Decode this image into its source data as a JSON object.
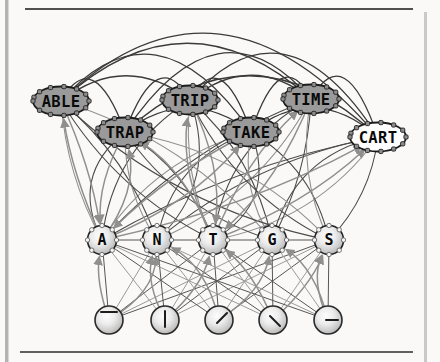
{
  "figure": {
    "background": "#faf9f7",
    "frame": {
      "left_bar_color": "#b3b3b3",
      "right_bar_color": "#c9c9c9",
      "top_rule_color": "#4f4f4f",
      "bottom_rule_color": "#5f5f5f"
    },
    "colors": {
      "word_fill": "#9a9a9a",
      "cart_fill": "#fefefe",
      "node_stroke": "#1c1c1c",
      "label_color": "#0a0a0a",
      "edge_dark": "#3a3a3a",
      "edge_mid": "#4a4a4a",
      "edge_gray": "#8f8f8f",
      "knob_fill": "#8d8d8d",
      "knob_stroke": "#1f1f1f",
      "letter_knob_fill": "#f4f4f4",
      "letter_knob_stroke": "#555555",
      "glyph_color": "#1d1d1d"
    }
  },
  "nodes": {
    "words": [
      {
        "id": "ABLE",
        "label": "ABLE",
        "x": 61,
        "y": 101,
        "fill": "word"
      },
      {
        "id": "TRAP",
        "label": "TRAP",
        "x": 125,
        "y": 132,
        "fill": "word"
      },
      {
        "id": "TRIP",
        "label": "TRIP",
        "x": 190,
        "y": 100,
        "fill": "word"
      },
      {
        "id": "TAKE",
        "label": "TAKE",
        "x": 251,
        "y": 132,
        "fill": "word"
      },
      {
        "id": "TIME",
        "label": "TIME",
        "x": 311,
        "y": 99,
        "fill": "word"
      },
      {
        "id": "CART",
        "label": "CART",
        "x": 378,
        "y": 137,
        "fill": "cart"
      }
    ],
    "letters": [
      {
        "id": "A",
        "label": "A",
        "x": 102,
        "y": 240
      },
      {
        "id": "N",
        "label": "N",
        "x": 157,
        "y": 240
      },
      {
        "id": "T",
        "label": "T",
        "x": 213,
        "y": 240
      },
      {
        "id": "G",
        "label": "G",
        "x": 272,
        "y": 240
      },
      {
        "id": "S",
        "label": "S",
        "x": 329,
        "y": 240
      }
    ],
    "features": [
      {
        "id": "feat-top-bar",
        "glyph": "horizontal-bar-top",
        "x": 109,
        "y": 320,
        "segment": [
          -8,
          -8,
          8,
          -8
        ]
      },
      {
        "id": "feat-vertical",
        "glyph": "vertical-bar",
        "x": 165,
        "y": 320,
        "segment": [
          0,
          -9,
          0,
          7
        ]
      },
      {
        "id": "feat-diag-up",
        "glyph": "diagonal-rising",
        "x": 219,
        "y": 320,
        "segment": [
          -2,
          3,
          8,
          -7
        ]
      },
      {
        "id": "feat-diag-down",
        "glyph": "diagonal-falling",
        "x": 273,
        "y": 320,
        "segment": [
          -3,
          -4,
          7,
          6
        ]
      },
      {
        "id": "feat-horizontal",
        "glyph": "horizontal-bar-right",
        "x": 328,
        "y": 320,
        "segment": [
          -2,
          0,
          10,
          0
        ]
      }
    ]
  },
  "edges": {
    "word_word_inhibitory": [
      [
        "ABLE",
        "TRAP"
      ],
      [
        "ABLE",
        "TRIP"
      ],
      [
        "ABLE",
        "TAKE"
      ],
      [
        "ABLE",
        "TIME"
      ],
      [
        "ABLE",
        "CART"
      ],
      [
        "TRAP",
        "TRIP"
      ],
      [
        "TRAP",
        "TAKE"
      ],
      [
        "TRAP",
        "TIME"
      ],
      [
        "TRAP",
        "CART"
      ],
      [
        "TRIP",
        "TAKE"
      ],
      [
        "TRIP",
        "TIME"
      ],
      [
        "TRIP",
        "CART"
      ],
      [
        "TAKE",
        "TIME"
      ],
      [
        "TAKE",
        "CART"
      ],
      [
        "TIME",
        "CART"
      ]
    ],
    "letter_word": [
      [
        "A",
        "ABLE"
      ],
      [
        "A",
        "TRAP"
      ],
      [
        "A",
        "TRIP"
      ],
      [
        "A",
        "TAKE"
      ],
      [
        "A",
        "TIME"
      ],
      [
        "A",
        "CART"
      ],
      [
        "N",
        "ABLE"
      ],
      [
        "N",
        "TRAP"
      ],
      [
        "N",
        "TRIP"
      ],
      [
        "N",
        "TAKE"
      ],
      [
        "N",
        "TIME"
      ],
      [
        "N",
        "CART"
      ],
      [
        "T",
        "ABLE"
      ],
      [
        "T",
        "TRAP"
      ],
      [
        "T",
        "TRIP"
      ],
      [
        "T",
        "TAKE"
      ],
      [
        "T",
        "TIME"
      ],
      [
        "T",
        "CART"
      ],
      [
        "G",
        "ABLE"
      ],
      [
        "G",
        "TRAP"
      ],
      [
        "G",
        "TRIP"
      ],
      [
        "G",
        "TAKE"
      ],
      [
        "G",
        "TIME"
      ],
      [
        "G",
        "CART"
      ],
      [
        "S",
        "ABLE"
      ],
      [
        "S",
        "TRAP"
      ],
      [
        "S",
        "TRIP"
      ],
      [
        "S",
        "TAKE"
      ],
      [
        "S",
        "TIME"
      ],
      [
        "S",
        "CART"
      ]
    ],
    "letter_letter_inhibitory": [
      [
        "A",
        "S"
      ]
    ],
    "feature_letter": [
      [
        "feat-top-bar",
        "A"
      ],
      [
        "feat-top-bar",
        "N"
      ],
      [
        "feat-top-bar",
        "T"
      ],
      [
        "feat-top-bar",
        "G"
      ],
      [
        "feat-top-bar",
        "S"
      ],
      [
        "feat-vertical",
        "A"
      ],
      [
        "feat-vertical",
        "N"
      ],
      [
        "feat-vertical",
        "T"
      ],
      [
        "feat-vertical",
        "G"
      ],
      [
        "feat-vertical",
        "S"
      ],
      [
        "feat-diag-up",
        "A"
      ],
      [
        "feat-diag-up",
        "N"
      ],
      [
        "feat-diag-up",
        "T"
      ],
      [
        "feat-diag-up",
        "G"
      ],
      [
        "feat-diag-up",
        "S"
      ],
      [
        "feat-diag-down",
        "A"
      ],
      [
        "feat-diag-down",
        "N"
      ],
      [
        "feat-diag-down",
        "T"
      ],
      [
        "feat-diag-down",
        "G"
      ],
      [
        "feat-diag-down",
        "S"
      ],
      [
        "feat-horizontal",
        "A"
      ],
      [
        "feat-horizontal",
        "N"
      ],
      [
        "feat-horizontal",
        "T"
      ],
      [
        "feat-horizontal",
        "G"
      ],
      [
        "feat-horizontal",
        "S"
      ]
    ],
    "excitatory_arrows": {
      "letter_to_word": [
        [
          "A",
          "ABLE"
        ],
        [
          "A",
          "TRAP"
        ],
        [
          "T",
          "TRAP"
        ],
        [
          "T",
          "TRIP"
        ],
        [
          "A",
          "TAKE"
        ],
        [
          "T",
          "TIME"
        ],
        [
          "T",
          "CART"
        ],
        [
          "A",
          "CART"
        ]
      ],
      "word_to_letter": [
        [
          "ABLE",
          "A"
        ],
        [
          "TRAP",
          "A"
        ],
        [
          "TRIP",
          "T"
        ],
        [
          "TIME",
          "T"
        ],
        [
          "TAKE",
          "A"
        ]
      ],
      "feature_to_letter": [
        [
          "feat-top-bar",
          "A"
        ],
        [
          "feat-top-bar",
          "N"
        ],
        [
          "feat-vertical",
          "N"
        ],
        [
          "feat-vertical",
          "T"
        ],
        [
          "feat-diag-up",
          "N"
        ],
        [
          "feat-diag-up",
          "G"
        ],
        [
          "feat-diag-down",
          "T"
        ],
        [
          "feat-diag-down",
          "S"
        ],
        [
          "feat-horizontal",
          "G"
        ],
        [
          "feat-horizontal",
          "S"
        ]
      ]
    }
  }
}
